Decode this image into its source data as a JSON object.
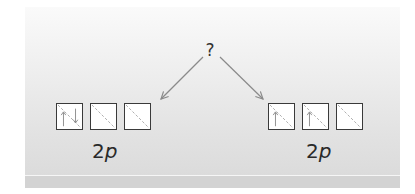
{
  "diagram": {
    "center_label": "?",
    "left_group": {
      "label_number": "2",
      "label_letter": "p",
      "orbitals": [
        {
          "electrons": [
            "up",
            "down"
          ]
        },
        {
          "electrons": []
        },
        {
          "electrons": []
        }
      ]
    },
    "right_group": {
      "label_number": "2",
      "label_letter": "p",
      "orbitals": [
        {
          "electrons": [
            "up"
          ]
        },
        {
          "electrons": [
            "up"
          ]
        },
        {
          "electrons": []
        }
      ]
    },
    "colors": {
      "box_border": "#3a3a3a",
      "arrow": "#8a8a8a",
      "dashed_diagonal": "#aaaaaa",
      "text": "#2a2a2a"
    }
  }
}
